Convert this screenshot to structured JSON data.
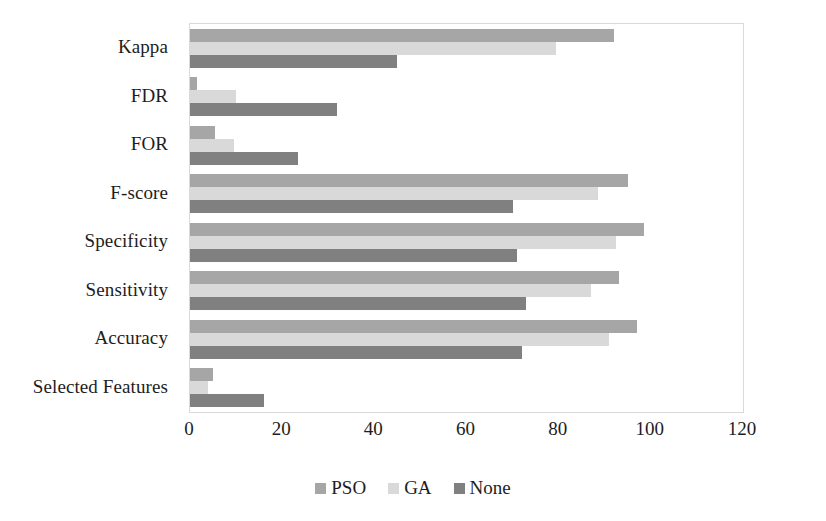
{
  "chart_data": {
    "type": "bar",
    "orientation": "horizontal",
    "title": "",
    "xlabel": "",
    "ylabel": "",
    "xlim": [
      0,
      120
    ],
    "xticks": [
      "0",
      "20",
      "40",
      "60",
      "80",
      "100",
      "120"
    ],
    "xtick_values": [
      0,
      20,
      40,
      60,
      80,
      100,
      120
    ],
    "grid": false,
    "legend_position": "bottom-center",
    "categories": [
      "Kappa",
      "FDR",
      "FOR",
      "F-score",
      "Specificity",
      "Sensitivity",
      "Accuracy",
      "Selected Features"
    ],
    "series": [
      {
        "name": "PSO",
        "color": "#a6a6a6",
        "values": [
          92,
          1.5,
          5.5,
          95,
          98.5,
          93,
          97,
          5
        ]
      },
      {
        "name": "GA",
        "color": "#d9d9d9",
        "values": [
          79.5,
          10,
          9.5,
          88.5,
          92.5,
          87,
          91,
          4
        ]
      },
      {
        "name": "None",
        "color": "#808080",
        "values": [
          45,
          32,
          23.5,
          70,
          71,
          73,
          72,
          16
        ]
      }
    ]
  },
  "legend": {
    "items": [
      {
        "label": "PSO",
        "swatch": "legend-swatch-pso"
      },
      {
        "label": "GA",
        "swatch": "legend-swatch-ga"
      },
      {
        "label": "None",
        "swatch": "legend-swatch-none"
      }
    ]
  }
}
